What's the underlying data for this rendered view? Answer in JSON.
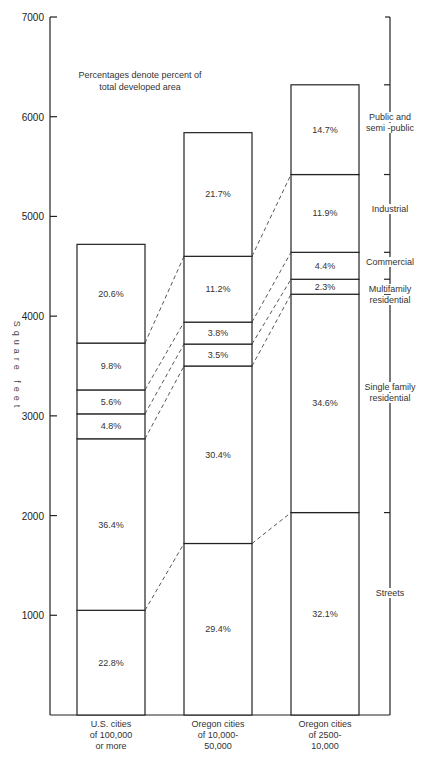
{
  "chart_data": {
    "type": "bar",
    "stacked": true,
    "title": "",
    "note": [
      "Percentages denote percent of",
      "total developed area"
    ],
    "xlabel": "",
    "ylabel": "Square feet",
    "ylim": [
      0,
      7000
    ],
    "yticks": [
      1000,
      2000,
      3000,
      4000,
      5000,
      6000,
      7000
    ],
    "grid": false,
    "legend_position": "right bracket",
    "categories": [
      [
        "U.S. cities",
        "of 100,000",
        "or more"
      ],
      [
        "Oregon cities",
        "of 10,000-",
        "50,000"
      ],
      [
        "Oregon cities",
        "of 2500-",
        "10,000"
      ]
    ],
    "series": [
      {
        "name": "Streets",
        "legend_lines": [
          "Streets"
        ],
        "values": [
          1050,
          1720,
          2030
        ],
        "percent_labels": [
          "22.8%",
          "29.4%",
          "32.1%"
        ]
      },
      {
        "name": "Single family residential",
        "legend_lines": [
          "Single family",
          "residential"
        ],
        "values": [
          1720,
          1780,
          2190
        ],
        "percent_labels": [
          "36.4%",
          "30.4%",
          "34.6%"
        ]
      },
      {
        "name": "Multifamily residential",
        "legend_lines": [
          "Multifamily",
          "residential"
        ],
        "values": [
          250,
          220,
          150
        ],
        "percent_labels": [
          "4.8%",
          "3.5%",
          "2.3%"
        ]
      },
      {
        "name": "Commercial",
        "legend_lines": [
          "Commercial"
        ],
        "values": [
          240,
          220,
          270
        ],
        "percent_labels": [
          "5.6%",
          "3.8%",
          "4.4%"
        ]
      },
      {
        "name": "Industrial",
        "legend_lines": [
          "Industrial"
        ],
        "values": [
          470,
          660,
          780
        ],
        "percent_labels": [
          "9.8%",
          "11.2%",
          "11.9%"
        ]
      },
      {
        "name": "Public and semi-public",
        "legend_lines": [
          "Public and",
          "semi -public"
        ],
        "values": [
          990,
          1240,
          900
        ],
        "percent_labels": [
          "20.6%",
          "21.7%",
          "14.7%"
        ]
      }
    ],
    "totals": [
      4720,
      5840,
      6320
    ]
  }
}
